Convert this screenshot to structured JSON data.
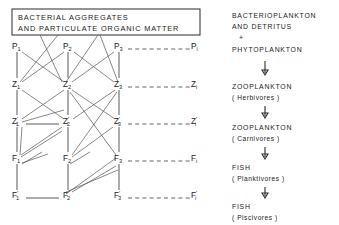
{
  "figure": {
    "title_box": {
      "line1": "BACTERIAL  AGGREGATES",
      "line2": "AND  PARTICULATE  ORGANIC  MATTER"
    },
    "rows": [
      {
        "key": "P",
        "symbol": "P",
        "prime": "",
        "labels": [
          "P1",
          "P2",
          "P3",
          "Pi"
        ]
      },
      {
        "key": "Z",
        "symbol": "Z",
        "prime": "",
        "labels": [
          "Z1",
          "Z2",
          "Z3",
          "Zi"
        ]
      },
      {
        "key": "Zp",
        "symbol": "Z",
        "prime": "'",
        "labels": [
          "Z'1",
          "Z'2",
          "Z'3",
          "Z'i"
        ]
      },
      {
        "key": "F",
        "symbol": "F",
        "prime": "",
        "labels": [
          "F1",
          "F2",
          "F3",
          "Fi"
        ]
      },
      {
        "key": "Fp",
        "symbol": "F",
        "prime": "'",
        "labels": [
          "F'1",
          "F'2",
          "F'3",
          "F'i"
        ]
      }
    ],
    "subscripts": [
      "1",
      "2",
      "3",
      "i"
    ],
    "primes": {
      "none": "",
      "prime": "'"
    },
    "right_column": [
      {
        "id": "bacterioplankton",
        "line1": "BACTERIOPLANKTON",
        "line2": "AND  DETRITUS",
        "paren": ""
      },
      {
        "id": "plus",
        "line1": "+",
        "line2": "",
        "paren": ""
      },
      {
        "id": "phytoplankton",
        "line1": "PHYTOPLANKTON",
        "line2": "",
        "paren": ""
      },
      {
        "id": "zooplankton-herbivores",
        "line1": "ZOOPLANKTON",
        "line2": "",
        "paren": "( Herbivores )"
      },
      {
        "id": "zooplankton-carnivores",
        "line1": "ZOOPLANKTON",
        "line2": "",
        "paren": "( Carnivores )"
      },
      {
        "id": "fish-planktivores",
        "line1": "FISH",
        "line2": "",
        "paren": "( Planktivores )"
      },
      {
        "id": "fish-piscivores",
        "line1": "FISH",
        "line2": "",
        "paren": "( Piscivores )"
      }
    ],
    "colors": {
      "ink": "#1a1a1a",
      "line": "#3c3c3c",
      "dashed": "#4a4a4a",
      "background": "#ffffff"
    }
  }
}
